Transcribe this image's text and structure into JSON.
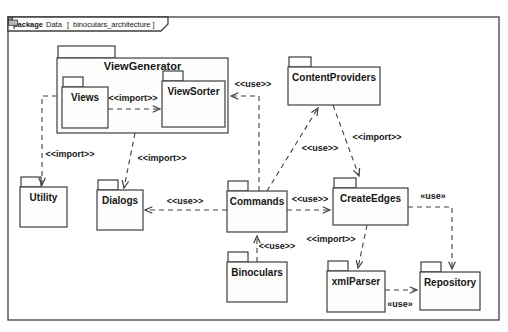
{
  "frame": {
    "keyword": "package",
    "title": "Data",
    "open_bracket": "[",
    "diagram_name": "binoculars_architecture",
    "close_bracket": "]",
    "x": 8,
    "y": 17,
    "w": 491,
    "h": 303,
    "tab_w": 160,
    "tab_h": 14
  },
  "style": {
    "line_color": "#3f3f3f",
    "text_color": "#161616",
    "fill_color": "#fdfdfc",
    "bg_color": "#ffffff"
  },
  "packages": [
    {
      "id": "viewgenerator",
      "label": "ViewGenerator",
      "x": 57,
      "y": 58,
      "w": 171,
      "h": 75,
      "tab_w": 57,
      "tab_h": 12,
      "big": true,
      "name_dy": 12
    },
    {
      "id": "views",
      "label": "Views",
      "x": 62,
      "y": 87,
      "w": 46,
      "h": 41,
      "tab_w": 20,
      "tab_h": 10
    },
    {
      "id": "viewsorter",
      "label": "ViewSorter",
      "x": 162,
      "y": 81,
      "w": 63,
      "h": 46,
      "tab_w": 20,
      "tab_h": 10
    },
    {
      "id": "contentproviders",
      "label": "ContentProviders",
      "x": 288,
      "y": 67,
      "w": 92,
      "h": 38,
      "tab_w": 22,
      "tab_h": 10
    },
    {
      "id": "utility",
      "label": "Utility",
      "x": 20,
      "y": 187,
      "w": 47,
      "h": 40,
      "tab_w": 20,
      "tab_h": 10
    },
    {
      "id": "dialogs",
      "label": "Dialogs",
      "x": 97,
      "y": 190,
      "w": 46,
      "h": 40,
      "tab_w": 20,
      "tab_h": 10
    },
    {
      "id": "commands",
      "label": "Commands",
      "x": 227,
      "y": 191,
      "w": 60,
      "h": 41,
      "tab_w": 20,
      "tab_h": 10
    },
    {
      "id": "createedges",
      "label": "CreateEdges",
      "x": 333,
      "y": 188,
      "w": 75,
      "h": 37,
      "tab_w": 22,
      "tab_h": 10
    },
    {
      "id": "binoculars",
      "label": "Binoculars",
      "x": 227,
      "y": 262,
      "w": 60,
      "h": 40,
      "tab_w": 20,
      "tab_h": 10
    },
    {
      "id": "xmlparser",
      "label": "xmlParser",
      "x": 327,
      "y": 271,
      "w": 58,
      "h": 41,
      "tab_w": 20,
      "tab_h": 10
    },
    {
      "id": "repository",
      "label": "Repository",
      "x": 420,
      "y": 272,
      "w": 60,
      "h": 38,
      "tab_w": 20,
      "tab_h": 10
    }
  ],
  "edges": [
    {
      "name": "views-imports-viewsorter",
      "stereotype": "<<import>>",
      "points": [
        [
          108,
          109
        ],
        [
          160,
          109
        ]
      ],
      "label": [
        133,
        101
      ]
    },
    {
      "name": "viewgenerator-imports-utility",
      "stereotype": "<<import>>",
      "points": [
        [
          57,
          96
        ],
        [
          42,
          96
        ],
        [
          42,
          185
        ]
      ],
      "label": [
        70,
        157
      ]
    },
    {
      "name": "viewgenerator-imports-dialogs",
      "stereotype": "<<import>>",
      "points": [
        [
          135,
          133
        ],
        [
          124,
          188
        ]
      ],
      "label": [
        162,
        161
      ]
    },
    {
      "name": "commands-uses-viewsorter",
      "stereotype": "<<use>>",
      "points": [
        [
          259,
          191
        ],
        [
          259,
          96
        ],
        [
          231,
          96
        ]
      ],
      "label": [
        253,
        87
      ]
    },
    {
      "name": "commands-uses-contentproviders",
      "stereotype": "<<use>>",
      "points": [
        [
          267,
          191
        ],
        [
          318,
          108
        ]
      ],
      "label": [
        320,
        151
      ]
    },
    {
      "name": "contentproviders-imports-createedges",
      "stereotype": "<<import>>",
      "points": [
        [
          333,
          105
        ],
        [
          359,
          176
        ]
      ],
      "label": [
        377,
        140
      ]
    },
    {
      "name": "commands-uses-dialogs",
      "stereotype": "<<use>>",
      "points": [
        [
          227,
          210
        ],
        [
          145,
          210
        ]
      ],
      "label": [
        185,
        204
      ]
    },
    {
      "name": "commands-uses-createedges",
      "stereotype": "<<use>>",
      "points": [
        [
          287,
          210
        ],
        [
          330,
          210
        ]
      ],
      "label": [
        310,
        202
      ]
    },
    {
      "name": "binoculars-uses-commands",
      "stereotype": "<<use>>",
      "points": [
        [
          257,
          262
        ],
        [
          257,
          236
        ]
      ],
      "label": [
        277,
        249
      ]
    },
    {
      "name": "createedges-imports-xmlparser",
      "stereotype": "<<import>>",
      "points": [
        [
          367,
          225
        ],
        [
          358,
          268
        ]
      ],
      "label": [
        331,
        242
      ]
    },
    {
      "name": "createedges-uses-repository",
      "stereotype": "«use»",
      "points": [
        [
          408,
          207
        ],
        [
          452,
          207
        ],
        [
          452,
          269
        ]
      ],
      "label": [
        433,
        199
      ]
    },
    {
      "name": "xmlparser-uses-repository",
      "stereotype": "«use»",
      "points": [
        [
          385,
          290
        ],
        [
          417,
          290
        ]
      ],
      "label": [
        400,
        307
      ]
    }
  ]
}
